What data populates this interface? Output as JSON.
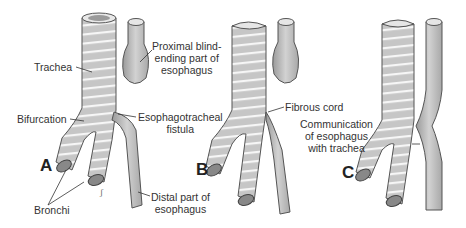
{
  "figure": {
    "panels": [
      {
        "letter": "A",
        "labels": {
          "trachea": "Trachea",
          "proximal": [
            "Proximal blind-",
            "ending part of",
            "esophagus"
          ],
          "bifurcation": "Bifurcation",
          "fistula": [
            "Esophagotracheal",
            "fistula"
          ],
          "bronchi": "Bronchi",
          "distal": [
            "Distal part of",
            "esophagus"
          ]
        }
      },
      {
        "letter": "B",
        "labels": {
          "fibrous_cord": "Fibrous cord"
        }
      },
      {
        "letter": "C",
        "labels": {
          "communication": [
            "Communication",
            "of esophagus",
            "with trachea"
          ]
        }
      }
    ],
    "colors": {
      "tube_fill": "#c9c9c9",
      "tube_stroke": "#555555",
      "ring": "#f4f4f4",
      "text": "#333333"
    }
  }
}
